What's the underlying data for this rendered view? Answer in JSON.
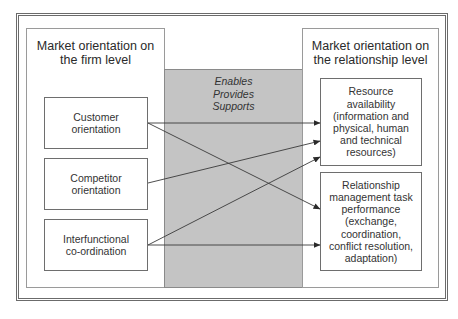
{
  "left_panel": {
    "title_line1": "Market orientation on",
    "title_line2": "the firm level",
    "boxes": [
      {
        "line1": "Customer",
        "line2": "orientation"
      },
      {
        "line1": "Competitor",
        "line2": "orientation"
      },
      {
        "line1": "Interfunctional",
        "line2": "co-ordination"
      }
    ]
  },
  "middle": {
    "labels": [
      "Enables",
      "Provides",
      "Supports"
    ],
    "fill_color": "#c4c4c4"
  },
  "right_panel": {
    "title_line1": "Market orientation on",
    "title_line2": "the relationship level",
    "boxes": [
      {
        "lines": [
          "Resource",
          "availability",
          "(information and",
          "physical, human",
          "and technical",
          "resources)"
        ]
      },
      {
        "lines": [
          "Relationship",
          "management task",
          "performance",
          "(exchange,",
          "coordination,",
          "conflict resolution,",
          "adaptation)"
        ]
      }
    ]
  },
  "connections": [
    {
      "from": "Customer orientation",
      "to": "Resource availability"
    },
    {
      "from": "Customer orientation",
      "to": "Relationship management task performance"
    },
    {
      "from": "Competitor orientation",
      "to": "Resource availability"
    },
    {
      "from": "Interfunctional co-ordination",
      "to": "Resource availability"
    },
    {
      "from": "Interfunctional co-ordination",
      "to": "Relationship management task performance"
    }
  ]
}
